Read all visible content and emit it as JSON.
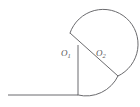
{
  "figure": {
    "background_color": "#ffffff",
    "stroke_color": "#6b6b6e",
    "label_color": "#575759",
    "width": 140,
    "height": 107,
    "labels": {
      "center_left": "O",
      "center_left_sub": "1",
      "center_right": "O",
      "center_right_sub": "2"
    },
    "geometry": {
      "circle": {
        "center_x": 93,
        "center_y": 59,
        "radius": 35
      },
      "major_arc": {
        "start_x": 70,
        "start_y": 33,
        "end_x": 118,
        "end_y": 76,
        "sweep": "clockwise-major"
      },
      "diagonal_radius": {
        "x1": 70,
        "y1": 33,
        "x2": 118,
        "y2": 76
      },
      "vertical_line": {
        "x1": 78,
        "y1": 45,
        "x2": 78,
        "y2": 95
      },
      "horizontal_baseline": {
        "x1": 8,
        "y1": 95,
        "x2": 78,
        "y2": 95
      },
      "lower_left_arc": {
        "start_x": 78,
        "start_y": 95,
        "end_x": 118,
        "end_y": 76
      }
    }
  }
}
